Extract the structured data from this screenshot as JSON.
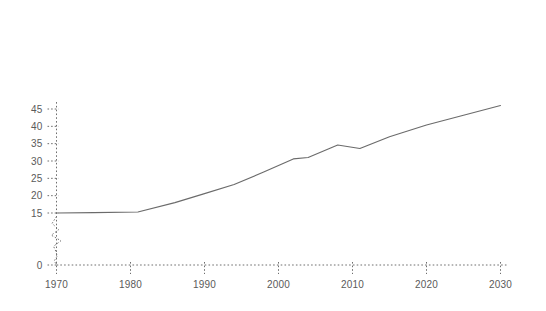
{
  "chart_data": {
    "type": "line",
    "title": "",
    "subtitle": "",
    "xlabel": "",
    "ylabel": "",
    "xlim": [
      1968,
      2031
    ],
    "ylim": [
      0,
      47
    ],
    "grid": false,
    "legend": "none",
    "x_ticks": [
      1970,
      1980,
      1990,
      2000,
      2010,
      2020,
      2030
    ],
    "x_tick_labels": [
      "1970",
      "1980",
      "1990",
      "2000",
      "2010",
      "2020",
      "2030"
    ],
    "y_ticks": [
      0,
      15,
      20,
      25,
      30,
      35,
      40,
      45
    ],
    "y_tick_labels": [
      "0",
      "15",
      "20",
      "25",
      "30",
      "35",
      "40",
      "45"
    ],
    "series": [
      {
        "name": "main",
        "style": "solid",
        "color": "#6b6b6b",
        "x": [
          1970,
          1975,
          1981,
          1986,
          1990,
          1994,
          1998,
          2002,
          2004,
          2008,
          2011,
          2015,
          2020,
          2025,
          2030
        ],
        "values": [
          15.0,
          15.1,
          15.3,
          18.0,
          20.6,
          23.2,
          26.8,
          30.6,
          31.0,
          34.6,
          33.6,
          37.0,
          40.4,
          43.2,
          46.0
        ]
      },
      {
        "name": "origin-noise",
        "style": "dotted",
        "color": "#737373",
        "x": [
          1970.0,
          1969.4,
          1970.3,
          1969.3,
          1970.6,
          1969.6,
          1969.9,
          1970.1,
          1969.7,
          1970.0
        ],
        "values": [
          14.0,
          12.0,
          10.2,
          8.6,
          7.0,
          5.4,
          4.0,
          2.6,
          1.2,
          0.0
        ]
      }
    ],
    "axis_color": "#6e6e6e",
    "label_color": "#5a5a5a",
    "background": "#ffffff"
  }
}
